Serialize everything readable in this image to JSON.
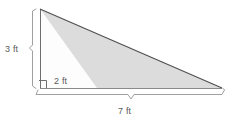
{
  "figure": {
    "labels": {
      "height": "3 ft",
      "side": "2 ft",
      "base": "7 ft"
    },
    "colors": {
      "fill_shaded": "#dcdcdc",
      "fill_unshaded": "#ffffff",
      "outline": "#6b6b6b",
      "hypotenuse": "#555555",
      "brace": "#9a9a9a",
      "text": "#5a5a5a",
      "background": "#ffffff"
    },
    "geometry": {
      "apex": [
        40,
        9
      ],
      "right_angle_corner": [
        40,
        88
      ],
      "base_right": [
        222,
        88
      ],
      "shade_divider_base": [
        97,
        88
      ],
      "right_angle_marker": [
        38,
        77,
        8,
        8
      ],
      "height_brace": {
        "x": 33,
        "y_top": 9,
        "y_bottom": 88,
        "notch_y": 48
      },
      "base_brace": {
        "y": 94,
        "x_left": 38,
        "x_right": 224,
        "notch_x": 131
      }
    }
  }
}
